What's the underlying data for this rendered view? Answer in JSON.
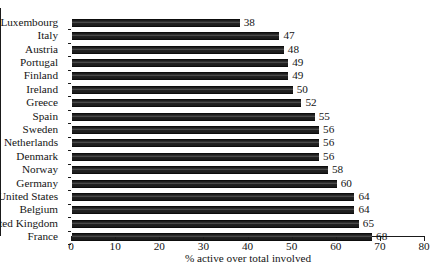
{
  "chart_data": {
    "type": "bar",
    "orientation": "horizontal",
    "title": "",
    "xlabel": "% active over total involved",
    "ylabel": "",
    "xlim": [
      0,
      80
    ],
    "xticks": [
      0,
      10,
      20,
      30,
      40,
      50,
      60,
      70,
      80
    ],
    "grid": false,
    "legend": null,
    "categories": [
      "Luxembourg",
      "Italy",
      "Austria",
      "Portugal",
      "Finland",
      "Ireland",
      "Greece",
      "Spain",
      "Sweden",
      "Netherlands",
      "Denmark",
      "Norway",
      "Germany",
      "United States",
      "Belgium",
      "United Kingdom",
      "France"
    ],
    "values": [
      38,
      47,
      48,
      49,
      49,
      50,
      52,
      55,
      56,
      56,
      56,
      58,
      60,
      64,
      64,
      65,
      68
    ],
    "data_labels": [
      "38",
      "47",
      "48",
      "49",
      "49",
      "50",
      "52",
      "55",
      "56",
      "56",
      "56",
      "58",
      "60",
      "64",
      "64",
      "65",
      "68"
    ],
    "bar_color": "#272727",
    "axis_color": "#1a1a1a",
    "text_color": "#141414"
  }
}
